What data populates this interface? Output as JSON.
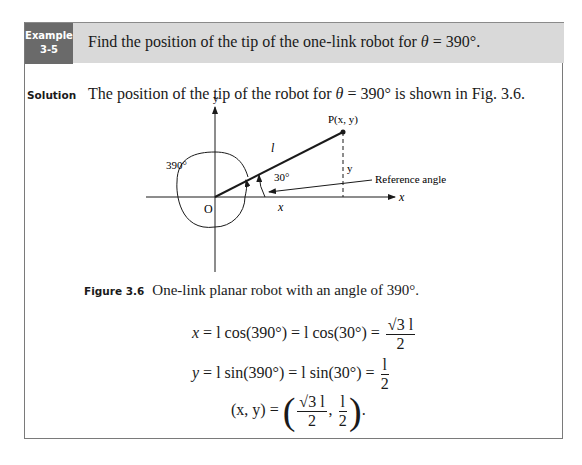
{
  "example": {
    "label_line1": "Example",
    "label_line2": "3-5",
    "title_prefix": "Find the position of the tip of the one-link robot for ",
    "title_theta": "θ",
    "title_suffix": " = 390°."
  },
  "solution": {
    "label": "Solution",
    "text_prefix": "The position of the tip of the robot for ",
    "text_theta": "θ",
    "text_suffix": " = 390° is shown in Fig. 3.6."
  },
  "figure": {
    "labels": {
      "y_axis": "y",
      "x_axis": "x",
      "origin": "O",
      "point": "P(x, y)",
      "link": "l",
      "angle_total": "390°",
      "angle_ref": "30°",
      "x_component": "x",
      "y_component": "y",
      "reference": "Reference angle"
    },
    "caption_number": "Figure 3.6",
    "caption_text": "One-link planar robot with an angle of 390°."
  },
  "equations": {
    "eq1": {
      "lhs": "x",
      "mid": " = l cos(390°) = l cos(30°)  = ",
      "num": "√3 l",
      "den": "2"
    },
    "eq2": {
      "lhs": "y",
      "mid": " = l sin(390°)  =  l sin(30°)  = ",
      "num": "l",
      "den": "2"
    },
    "eq3": {
      "lhs": "(x, y) = ",
      "num1": "√3 l",
      "den1": "2",
      "sep": ", ",
      "num2": "l",
      "den2": "2",
      "end": "."
    }
  }
}
